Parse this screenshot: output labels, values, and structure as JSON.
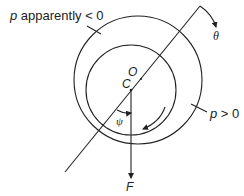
{
  "diagram": {
    "type": "mechanics free-body sketch of journal in bearing",
    "line_color": "#222222",
    "labels": {
      "p_negative": "p apparently < 0",
      "p_negative_var": "p",
      "p_negative_rest": " apparently < 0",
      "p_positive": "p > 0",
      "p_positive_var": "p",
      "p_positive_rest": " > 0",
      "theta": "θ",
      "center_O": "O",
      "center_C": "C",
      "psi": "ψ",
      "force": "F"
    },
    "elements": [
      {
        "name": "outer-circle",
        "kind": "circle",
        "cx": 138,
        "cy": 80,
        "r": 64
      },
      {
        "name": "inner-circle",
        "kind": "circle",
        "cx": 131,
        "cy": 90,
        "r": 45
      },
      {
        "name": "line-of-centers",
        "kind": "line",
        "from": [
          65,
          172
        ],
        "to": [
          200,
          6
        ]
      },
      {
        "name": "theta-arrow",
        "kind": "arrow",
        "from": [
          200,
          6
        ],
        "to": [
          215,
          26
        ]
      },
      {
        "name": "force-arrow",
        "kind": "arrow",
        "from": [
          131,
          91
        ],
        "to": [
          131,
          178
        ]
      },
      {
        "name": "psi-arc",
        "kind": "arc"
      },
      {
        "name": "rotation-arrow",
        "kind": "arc-arrow"
      }
    ]
  }
}
